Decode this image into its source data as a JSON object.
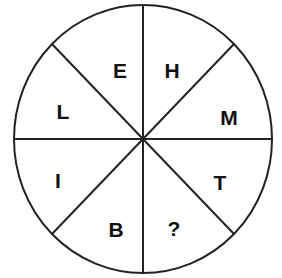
{
  "puzzle": {
    "type": "letter-wheel",
    "segments": [
      {
        "position": "top-left",
        "letter": "E"
      },
      {
        "position": "top-right",
        "letter": "H"
      },
      {
        "position": "right-upper",
        "letter": "M"
      },
      {
        "position": "right-lower",
        "letter": "T"
      },
      {
        "position": "bottom-right",
        "letter": "?"
      },
      {
        "position": "bottom-left",
        "letter": "B"
      },
      {
        "position": "left-lower",
        "letter": "I"
      },
      {
        "position": "left-upper",
        "letter": "L"
      }
    ]
  },
  "colors": {
    "line": "#222222",
    "text": "#111111",
    "background": "#ffffff"
  }
}
